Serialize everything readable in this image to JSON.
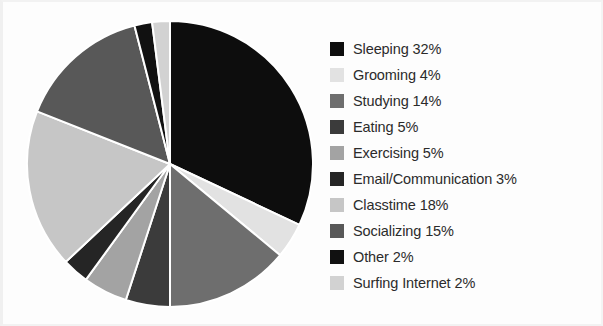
{
  "chart_data": {
    "type": "pie",
    "title": "",
    "subtitle": "",
    "xlabel": "",
    "ylabel": "",
    "legend_position": "right",
    "grid": false,
    "start_angle_deg": 0,
    "direction": "clockwise",
    "categories": [
      "Sleeping",
      "Grooming",
      "Studying",
      "Eating",
      "Exercising",
      "Email/Communication",
      "Classtime",
      "Socializing",
      "Other",
      "Surfing Internet"
    ],
    "values": [
      32,
      4,
      14,
      5,
      5,
      3,
      18,
      15,
      2,
      2
    ],
    "value_unit": "%",
    "colors": [
      "#0d0d0d",
      "#e2e2e2",
      "#6e6e6e",
      "#3b3b3b",
      "#a3a3a3",
      "#252525",
      "#c6c6c6",
      "#585858",
      "#111111",
      "#d2d2d2"
    ],
    "slice_separator_color": "#ffffff"
  },
  "legend": {
    "entries": [
      {
        "label": "Sleeping 32%",
        "color": "#0d0d0d",
        "name": "Sleeping",
        "value": 32
      },
      {
        "label": "Grooming 4%",
        "color": "#e2e2e2",
        "name": "Grooming",
        "value": 4
      },
      {
        "label": "Studying 14%",
        "color": "#6e6e6e",
        "name": "Studying",
        "value": 14
      },
      {
        "label": "Eating 5%",
        "color": "#3b3b3b",
        "name": "Eating",
        "value": 5
      },
      {
        "label": "Exercising 5%",
        "color": "#a3a3a3",
        "name": "Exercising",
        "value": 5
      },
      {
        "label": "Email/Communication 3%",
        "color": "#252525",
        "name": "Email/Communication",
        "value": 3
      },
      {
        "label": "Classtime 18%",
        "color": "#c6c6c6",
        "name": "Classtime",
        "value": 18
      },
      {
        "label": "Socializing 15%",
        "color": "#585858",
        "name": "Socializing",
        "value": 15
      },
      {
        "label": "Other 2%",
        "color": "#111111",
        "name": "Other",
        "value": 2
      },
      {
        "label": "Surfing Internet 2%",
        "color": "#d2d2d2",
        "name": "Surfing Internet",
        "value": 2
      }
    ]
  },
  "canvas": {
    "background": "#fdfdfd",
    "text_color": "#2b2b2b"
  }
}
